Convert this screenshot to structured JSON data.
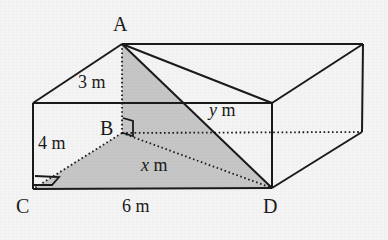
{
  "figure": {
    "background_color": "#f4f4f4",
    "line_color": "#1a1a1a",
    "shade_color": "#bfbfbf",
    "vertices": [
      {
        "id": "A",
        "label": "A",
        "x": 122,
        "y": 44,
        "label_x": 113,
        "label_y": 14
      },
      {
        "id": "B",
        "label": "B",
        "x": 122,
        "y": 133,
        "label_x": 100,
        "label_y": 118
      },
      {
        "id": "C",
        "label": "C",
        "x": 33,
        "y": 189,
        "label_x": 16,
        "label_y": 198
      },
      {
        "id": "D",
        "label": "D",
        "x": 272,
        "y": 188,
        "label_x": 264,
        "label_y": 198
      }
    ],
    "measurements": [
      {
        "id": "AB",
        "text": "3 m",
        "value": 3,
        "unit": "m",
        "x": 78,
        "y": 72,
        "segment": "A-B"
      },
      {
        "id": "BC",
        "text": "4 m",
        "value": 4,
        "unit": "m",
        "x": 38,
        "y": 134,
        "segment": "B-C"
      },
      {
        "id": "CD",
        "text": "6 m",
        "value": 6,
        "unit": "m",
        "x": 123,
        "y": 198,
        "segment": "C-D"
      },
      {
        "id": "BD",
        "text": "x m",
        "variable": "x",
        "unit": "m",
        "x": 140,
        "y": 155,
        "segment": "B-D"
      },
      {
        "id": "AD",
        "text": "y m",
        "variable": "y",
        "unit": "m",
        "x": 208,
        "y": 100,
        "segment": "A-D"
      }
    ],
    "right_angles": [
      {
        "id": "angle-at-B",
        "at": "B",
        "note": "right angle between AB and BD"
      },
      {
        "id": "angle-at-C",
        "at": "C",
        "note": "right angle between BC and CD"
      }
    ],
    "shaded_regions": [
      {
        "id": "triangle-BCD",
        "vertices": [
          "B",
          "C",
          "D"
        ]
      },
      {
        "id": "triangle-ABD",
        "vertices": [
          "A",
          "B",
          "D"
        ]
      }
    ]
  }
}
